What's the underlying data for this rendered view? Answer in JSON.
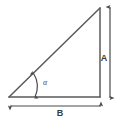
{
  "figure": {
    "background_color": "#ffffff",
    "stroke_color": "#555555",
    "label_color": "#3a3a3a",
    "triangle": {
      "name": "right-triangle",
      "vertices": {
        "bottom_left": {
          "x": 9,
          "y": 97
        },
        "top_right": {
          "x": 100,
          "y": 8
        },
        "bottom_right": {
          "x": 100,
          "y": 97
        }
      }
    },
    "labels": {
      "vertical_side": "A",
      "horizontal_side": "B",
      "angle": "α"
    },
    "dimension_lines": {
      "vertical": {
        "name": "dimension-arrow-a",
        "x": 110,
        "y_start": 6,
        "y_end": 99,
        "orientation": "vertical",
        "arrowheads": "both"
      },
      "horizontal": {
        "name": "dimension-arrow-b",
        "y": 106,
        "x_start": 9,
        "x_end": 102,
        "orientation": "horizontal",
        "arrowheads": "both"
      }
    },
    "angle_marker": {
      "name": "angle-arc-alpha",
      "vertex": {
        "x": 9,
        "y": 97
      },
      "radius": 26,
      "arrowheads": "both"
    }
  }
}
